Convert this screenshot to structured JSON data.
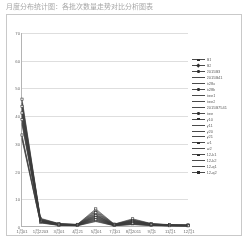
{
  "chart_title": "月度分布统计图：各批次数量走势对比分析图表",
  "legend": {
    "position": "right",
    "entries": [
      {
        "label": "B1",
        "marker": "sq"
      },
      {
        "label": "B2",
        "marker": "di"
      },
      {
        "label": "2015B3",
        "marker": "ci"
      },
      {
        "label": "2015B41",
        "marker": "none"
      },
      {
        "label": "b28a",
        "marker": "none"
      },
      {
        "label": "b28b",
        "marker": "ci"
      },
      {
        "label": "bee1",
        "marker": "none"
      },
      {
        "label": "bee2",
        "marker": "none"
      },
      {
        "label": "2015B7541",
        "marker": "none"
      },
      {
        "label": "bee",
        "marker": "ci"
      },
      {
        "label": "y10",
        "marker": "sq"
      },
      {
        "label": "y11",
        "marker": "none"
      },
      {
        "label": "y20",
        "marker": "none"
      },
      {
        "label": "y21",
        "marker": "none"
      },
      {
        "label": "w1",
        "marker": "sq"
      },
      {
        "label": "w2",
        "marker": "none"
      },
      {
        "label": "12-k1",
        "marker": "sq"
      },
      {
        "label": "12-k2",
        "marker": "none"
      },
      {
        "label": "12-q1",
        "marker": "none"
      },
      {
        "label": "12-q2",
        "marker": "sq"
      }
    ]
  },
  "chart_data": {
    "type": "line",
    "title": "月度分布统计图：各批次数量走势对比分析图表",
    "xlabel": "",
    "ylabel": "",
    "ylim": [
      0,
      70
    ],
    "yticks": [
      0,
      10,
      20,
      30,
      40,
      50,
      60,
      70
    ],
    "grid": true,
    "categories": [
      "1月01",
      "1月2203",
      "3月01",
      "4月21",
      "5月01",
      "7月01",
      "8月2011",
      "9月1",
      "11月1",
      "12月1"
    ],
    "series": [
      {
        "name": "B1",
        "values": [
          46.0,
          2.8,
          0.9,
          0.6,
          6.2,
          0.7,
          2.6,
          0.9,
          0.5,
          0.4
        ]
      },
      {
        "name": "B2",
        "values": [
          45.2,
          2.6,
          0.8,
          0.5,
          5.8,
          0.6,
          2.4,
          0.8,
          0.4,
          0.3
        ]
      },
      {
        "name": "2015B3",
        "values": [
          44.6,
          2.5,
          0.8,
          0.5,
          5.4,
          0.6,
          2.2,
          0.8,
          0.4,
          0.3
        ]
      },
      {
        "name": "2015B41",
        "values": [
          44.0,
          2.4,
          0.7,
          0.5,
          5.1,
          0.5,
          2.1,
          0.7,
          0.4,
          0.3
        ]
      },
      {
        "name": "b28a",
        "values": [
          43.4,
          2.3,
          0.7,
          0.4,
          4.8,
          0.5,
          2.0,
          0.7,
          0.3,
          0.3
        ]
      },
      {
        "name": "b28b",
        "values": [
          42.8,
          2.2,
          0.7,
          0.4,
          4.5,
          0.5,
          1.9,
          0.6,
          0.3,
          0.2
        ]
      },
      {
        "name": "bee1",
        "values": [
          42.2,
          2.1,
          0.6,
          0.4,
          4.2,
          0.4,
          1.8,
          0.6,
          0.3,
          0.2
        ]
      },
      {
        "name": "bee2",
        "values": [
          41.6,
          2.0,
          0.6,
          0.4,
          4.0,
          0.4,
          1.7,
          0.6,
          0.3,
          0.2
        ]
      },
      {
        "name": "2015B7541",
        "values": [
          41.0,
          2.0,
          0.6,
          0.3,
          3.8,
          0.4,
          1.6,
          0.5,
          0.3,
          0.2
        ]
      },
      {
        "name": "bee",
        "values": [
          40.4,
          1.9,
          0.5,
          0.3,
          3.6,
          0.4,
          1.5,
          0.5,
          0.2,
          0.2
        ]
      },
      {
        "name": "y10",
        "values": [
          39.8,
          1.8,
          0.5,
          0.3,
          3.4,
          0.3,
          1.4,
          0.5,
          0.2,
          0.2
        ]
      },
      {
        "name": "y11",
        "values": [
          39.2,
          1.8,
          0.5,
          0.3,
          3.2,
          0.3,
          1.3,
          0.4,
          0.2,
          0.1
        ]
      },
      {
        "name": "y20",
        "values": [
          38.6,
          1.7,
          0.4,
          0.3,
          3.0,
          0.3,
          1.2,
          0.4,
          0.2,
          0.1
        ]
      },
      {
        "name": "y21",
        "values": [
          38.0,
          1.6,
          0.4,
          0.2,
          2.8,
          0.3,
          1.1,
          0.4,
          0.2,
          0.1
        ]
      },
      {
        "name": "w1",
        "values": [
          37.4,
          1.6,
          0.4,
          0.2,
          2.6,
          0.2,
          1.0,
          0.3,
          0.1,
          0.1
        ]
      },
      {
        "name": "w2",
        "values": [
          36.8,
          1.5,
          0.4,
          0.2,
          2.4,
          0.2,
          0.9,
          0.3,
          0.1,
          0.1
        ]
      },
      {
        "name": "12-k1",
        "values": [
          33.0,
          1.4,
          0.3,
          0.2,
          2.2,
          0.2,
          0.8,
          0.3,
          0.1,
          0.1
        ]
      },
      {
        "name": "12-k2",
        "values": [
          32.4,
          1.3,
          0.3,
          0.2,
          2.0,
          0.2,
          0.7,
          0.2,
          0.1,
          0.1
        ]
      },
      {
        "name": "12-q1",
        "values": [
          31.9,
          1.2,
          0.3,
          0.1,
          1.8,
          0.1,
          0.6,
          0.2,
          0.1,
          0.0
        ]
      },
      {
        "name": "12-q2",
        "values": [
          31.4,
          1.1,
          0.2,
          0.1,
          1.6,
          0.1,
          0.5,
          0.2,
          0.1,
          0.0
        ]
      }
    ]
  }
}
